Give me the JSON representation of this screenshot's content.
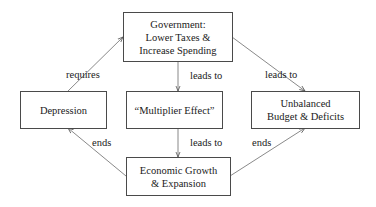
{
  "diagram": {
    "nodes": {
      "government": {
        "lines": [
          "Government:",
          "Lower Taxes &",
          "Increase Spending"
        ]
      },
      "depression": {
        "lines": [
          "Depression"
        ]
      },
      "multiplier": {
        "lines": [
          "“Multiplier Effect”"
        ]
      },
      "unbalanced": {
        "lines": [
          "Unbalanced",
          "Budget & Deficits"
        ]
      },
      "growth": {
        "lines": [
          "Economic Growth",
          "& Expansion"
        ]
      }
    },
    "edges": [
      {
        "from": "depression",
        "to": "government",
        "label": "requires"
      },
      {
        "from": "government",
        "to": "multiplier",
        "label": "leads to"
      },
      {
        "from": "government",
        "to": "unbalanced",
        "label": "leads to"
      },
      {
        "from": "multiplier",
        "to": "growth",
        "label": "leads to"
      },
      {
        "from": "growth",
        "to": "depression",
        "label": "ends"
      },
      {
        "from": "growth",
        "to": "unbalanced",
        "label": "ends"
      }
    ],
    "colors": {
      "line": "#6b6b6b",
      "border": "#4a4a4a",
      "text": "#1a1a1a",
      "background": "#ffffff"
    }
  }
}
